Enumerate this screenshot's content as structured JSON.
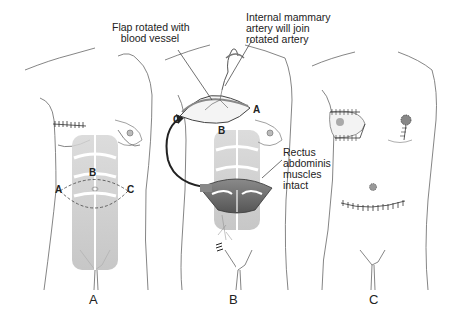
{
  "figure": {
    "panels": [
      {
        "id": "A",
        "label": "A",
        "points": {
          "a": "A",
          "b": "B",
          "c": "C"
        }
      },
      {
        "id": "B",
        "label": "B",
        "points": {
          "a": "A",
          "b": "B",
          "c": "C"
        }
      },
      {
        "id": "C",
        "label": "C"
      }
    ],
    "callouts": {
      "flap": "Flap rotated with\n   blood vessel",
      "artery": "Internal mammary\nartery will join\nrotated artery",
      "rectus": "Rectus\nabdominis\nmuscles\nintact"
    },
    "colors": {
      "outline": "#555555",
      "muscle": "#bdbdbd",
      "muscle_dark": "#6e6e6e",
      "suture": "#333333",
      "skin_shade": "#eeeeee"
    }
  }
}
